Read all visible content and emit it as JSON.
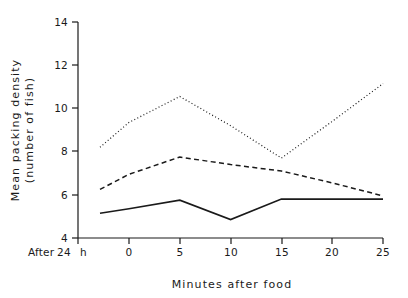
{
  "chart_data": {
    "type": "line",
    "title": "",
    "xlabel": "Minutes after food",
    "ylabel": "Mean packing density (number of fish)",
    "ylabel_line1": "Mean packing density",
    "ylabel_line2": "(number of fish)",
    "baseline_label": "After 24 h",
    "baseline_label_parts": [
      "After",
      "24",
      "h"
    ],
    "x": [
      -4,
      0,
      5,
      10,
      15,
      20,
      25
    ],
    "x_point_labels": [
      "After 24 h",
      "0",
      "5",
      "10",
      "15",
      "20",
      "25"
    ],
    "xticks": [
      0,
      5,
      10,
      15,
      20,
      25
    ],
    "xtick_labels": [
      "0",
      "5",
      "10",
      "15",
      "20",
      "25"
    ],
    "yticks": [
      4,
      6,
      8,
      10,
      12,
      14
    ],
    "ytick_labels": [
      "4",
      "6",
      "8",
      "10",
      "12",
      "14"
    ],
    "xlim": [
      -4,
      25
    ],
    "ylim": [
      4,
      14
    ],
    "grid": false,
    "legend": "none",
    "series": [
      {
        "name": "solid",
        "style": "solid",
        "color": "#1a1a1a",
        "values": [
          5.15,
          5.35,
          5.75,
          4.85,
          5.8,
          5.8,
          5.8
        ]
      },
      {
        "name": "dashed",
        "style": "dashed",
        "color": "#1a1a1a",
        "values": [
          6.25,
          6.95,
          7.75,
          7.4,
          7.1,
          6.55,
          5.95
        ]
      },
      {
        "name": "dotted",
        "style": "dotted",
        "color": "#1a1a1a",
        "values": [
          8.2,
          9.35,
          10.55,
          9.2,
          7.7,
          9.4,
          11.15
        ]
      }
    ]
  },
  "axis": {
    "x_title": "Minutes after food",
    "y_title_line1": "Mean packing density",
    "y_title_line2": "(number of fish)",
    "baseline_after": "After",
    "baseline_24": "24",
    "baseline_h": "h",
    "xtick_0": "0",
    "xtick_5": "5",
    "xtick_10": "10",
    "xtick_15": "15",
    "xtick_20": "20",
    "xtick_25": "25",
    "ytick_4": "4",
    "ytick_6": "6",
    "ytick_8": "8",
    "ytick_10": "10",
    "ytick_12": "12",
    "ytick_14": "14"
  },
  "colors": {
    "background": "#ffffff",
    "ink": "#1a1a1a"
  }
}
